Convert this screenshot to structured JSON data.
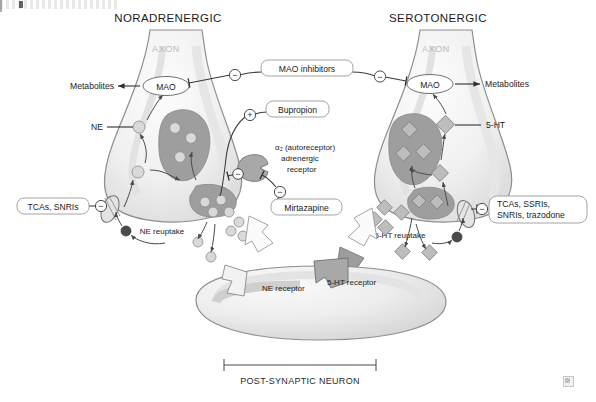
{
  "figure": {
    "titles": {
      "left": "NORADRENERGIC",
      "right": "SEROTONERGIC"
    },
    "axon_label": "AXON",
    "enzyme_label": "MAO",
    "metabolites_label": "Metabolites",
    "neurotransmitters": {
      "left": "NE",
      "right": "5-HT"
    },
    "reuptake": {
      "left": "NE reuptake",
      "right": "5-HT reuptake"
    },
    "receptors": {
      "left": "NE receptor",
      "right": "5-HT receptor"
    },
    "autoreceptor": {
      "line1": "α₂ (autoreceptor)",
      "line2": "adrenergic",
      "line3": "receptor"
    },
    "post_synaptic_label": "POST-SYNAPTIC NEURON",
    "drug_boxes": [
      {
        "id": "mao-inhibitors",
        "text": "MAO inhibitors",
        "sign": "−"
      },
      {
        "id": "bupropion",
        "text": "Bupropion",
        "sign": "+"
      },
      {
        "id": "mirtazapine",
        "text": "Mirtazapine",
        "sign": "−"
      },
      {
        "id": "tcas-snris",
        "text": "TCAs, SNRIs",
        "sign": "−"
      },
      {
        "id": "tcas-ssris-snris-trazodone",
        "line1": "TCAs, SSRIs,",
        "line2": "SNRIs, trazodone",
        "sign": "−"
      }
    ],
    "signs": {
      "inhibit": "−",
      "stimulate": "+"
    },
    "colors": {
      "ink": "#1b1b1b",
      "membrane": "#8e8e8e",
      "axon_text": "#b9b9b9",
      "vesicle_light": "#d9d9d9",
      "vesicle_dark": "#bdbdbd",
      "receptor_fill": "#a8a8a8",
      "box_border": "#9a9a9a",
      "background": "#ffffff"
    }
  }
}
